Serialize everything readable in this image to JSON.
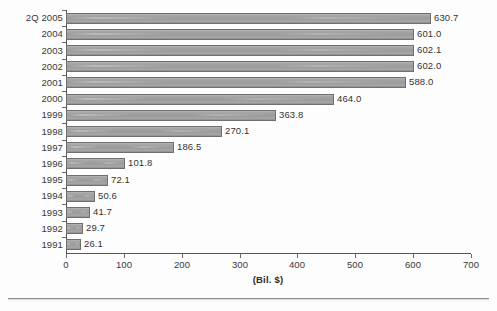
{
  "chart_data": {
    "type": "bar",
    "orientation": "horizontal",
    "title": "",
    "xlabel": "(Bil. $)",
    "ylabel": "",
    "xlim": [
      0,
      700
    ],
    "xticks": [
      0,
      100,
      200,
      300,
      400,
      500,
      600,
      700
    ],
    "grid": false,
    "legend": null,
    "bar_color": "#9d9d9d",
    "bar_edge_color": "#6f6f6f",
    "axis_color": "#555555",
    "categories": [
      "2Q 2005",
      "2004",
      "2003",
      "2002",
      "2001",
      "2000",
      "1999",
      "1998",
      "1997",
      "1996",
      "1995",
      "1994",
      "1993",
      "1992",
      "1991"
    ],
    "values": [
      630.7,
      601.0,
      602.1,
      602.0,
      588.0,
      464.0,
      363.8,
      270.1,
      186.5,
      101.8,
      72.1,
      50.6,
      41.7,
      29.7,
      26.1
    ],
    "value_labels": [
      "630.7",
      "601.0",
      "602.1",
      "602.0",
      "588.0",
      "464.0",
      "363.8",
      "270.1",
      "186.5",
      "101.8",
      "72.1",
      "50.6",
      "41.7",
      "29.7",
      "26.1"
    ]
  }
}
